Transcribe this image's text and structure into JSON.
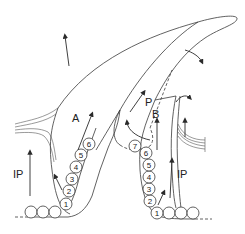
{
  "diagram": {
    "labels": {
      "left_ip": "IP",
      "right_ip": "IP",
      "a": "A",
      "b": "B",
      "p": "P"
    },
    "left_cells": [
      "1",
      "2",
      "3",
      "4",
      "5",
      "6"
    ],
    "right_cells": [
      "1",
      "2",
      "3",
      "4",
      "5",
      "6",
      "7"
    ],
    "colors": {
      "line": "#3a3a3a",
      "background": "#ffffff"
    }
  }
}
